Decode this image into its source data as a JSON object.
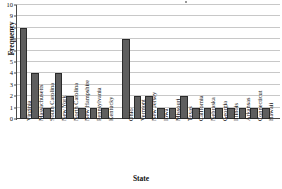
{
  "chart_data": {
    "type": "bar",
    "title": "",
    "xlabel": "State",
    "ylabel": "Frequency",
    "ylim": [
      0,
      10
    ],
    "yticks": [
      0,
      1,
      2,
      3,
      4,
      5,
      6,
      7,
      8,
      9,
      10
    ],
    "grid": true,
    "legend": false,
    "orientation": "vertical",
    "bar_color": "#5e5e5e",
    "bar_edge_color": "#2b2b2b",
    "gridline_color": "#c8c8c8",
    "axis_color": "#4a4a4a",
    "categories": [
      "Virginia",
      "Massachusetts",
      "South Carolina",
      "New York",
      "North Carolina",
      "New Hampshire",
      "Pennsylvania",
      "Kentucky",
      "Ohio",
      "Vermont",
      "New Jersey",
      "Iowa",
      "Missouri",
      "Texas",
      "California",
      "Nebraska",
      "Georgia",
      "Illinois",
      "Arkansas",
      "Connecticut",
      "Hawaii"
    ],
    "values": [
      8,
      4,
      1,
      4,
      2,
      1,
      1,
      1,
      7,
      2,
      2,
      1,
      1,
      2,
      1,
      1,
      1,
      1,
      1,
      1,
      1
    ]
  }
}
